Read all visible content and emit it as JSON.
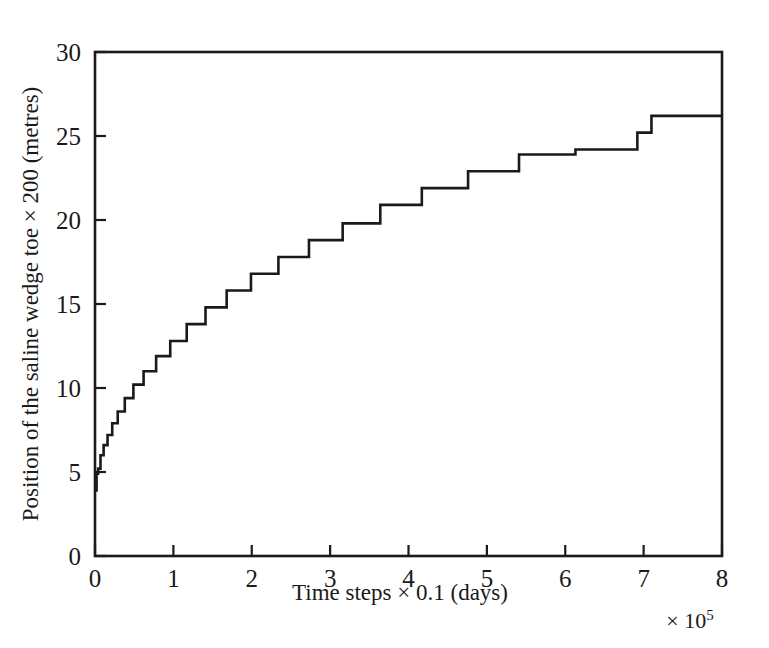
{
  "chart_data": {
    "type": "line",
    "title": "",
    "subtitle": "",
    "xlabel": "Time steps × 0.1 (days)",
    "ylabel": "Position of the saline wedge toe × 200 (metres)",
    "x_exponent_label": "× 10",
    "x_exponent_power": "5",
    "xlim": [
      0,
      8
    ],
    "ylim": [
      0,
      30
    ],
    "xticks": [
      0,
      1,
      2,
      3,
      4,
      5,
      6,
      7,
      8
    ],
    "yticks": [
      0,
      5,
      10,
      15,
      20,
      25,
      30
    ],
    "xtick_labels": [
      "0",
      "1",
      "2",
      "3",
      "4",
      "5",
      "6",
      "7",
      "8"
    ],
    "ytick_labels": [
      "0",
      "5",
      "10",
      "15",
      "20",
      "25",
      "30"
    ],
    "grid": false,
    "legend": null,
    "legend_position": "none",
    "line_color": "#1a1a1a",
    "background_color": "#ffffff",
    "step_style": "post",
    "series": [
      {
        "name": "Saline wedge toe position",
        "x": [
          0.0,
          0.02,
          0.04,
          0.07,
          0.11,
          0.16,
          0.22,
          0.29,
          0.38,
          0.49,
          0.62,
          0.78,
          0.96,
          1.17,
          1.41,
          1.68,
          1.99,
          2.34,
          2.73,
          3.16,
          3.64,
          4.17,
          4.76,
          5.41,
          6.13,
          6.92,
          7.1,
          8.0
        ],
        "y": [
          3.9,
          4.9,
          5.2,
          6.0,
          6.6,
          7.2,
          7.9,
          8.6,
          9.4,
          10.2,
          11.0,
          11.9,
          12.8,
          13.8,
          14.8,
          15.8,
          16.8,
          17.8,
          18.8,
          19.8,
          20.9,
          21.9,
          22.9,
          23.9,
          24.2,
          25.2,
          26.2,
          26.2
        ]
      }
    ]
  }
}
